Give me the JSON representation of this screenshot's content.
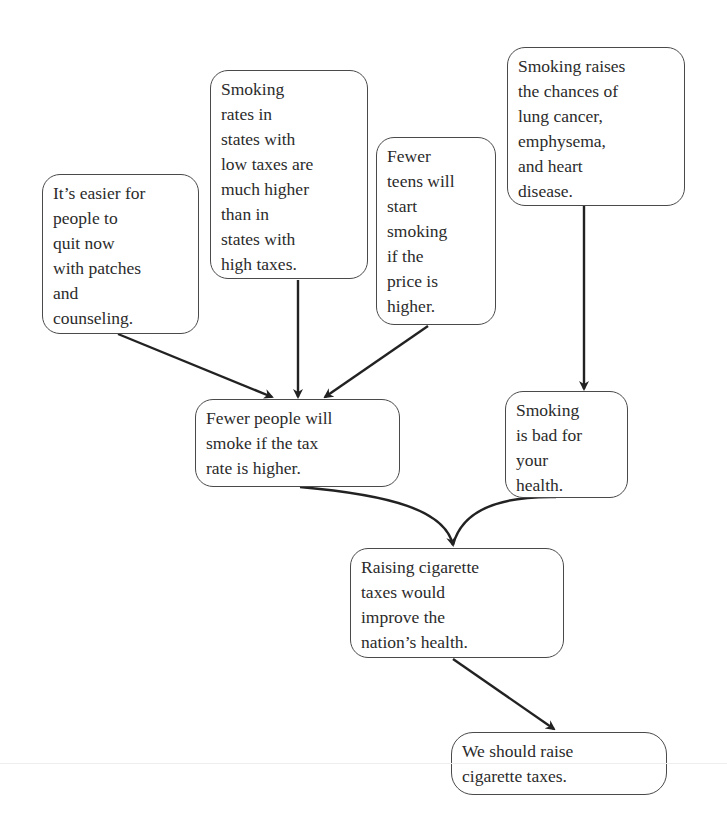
{
  "diagram": {
    "type": "argument-map",
    "nodes": [
      {
        "id": "a",
        "text": "It’s easier for\npeople to\nquit now\nwith patches\nand\ncounseling."
      },
      {
        "id": "b",
        "text": "Smoking\nrates in\nstates with\nlow taxes are\nmuch higher\nthan in\nstates with\nhigh taxes."
      },
      {
        "id": "c",
        "text": "Fewer\nteens will\nstart\nsmoking\nif the\nprice is\nhigher."
      },
      {
        "id": "d",
        "text": "Smoking raises\nthe chances of\nlung cancer,\nemphysema,\nand heart\ndisease."
      },
      {
        "id": "e",
        "text": "Fewer people will\nsmoke if the tax\nrate is higher."
      },
      {
        "id": "f",
        "text": "Smoking\nis bad for\nyour\nhealth."
      },
      {
        "id": "g",
        "text": "Raising cigarette\ntaxes would\nimprove the\nnation’s health."
      },
      {
        "id": "h",
        "text": "We should raise\ncigarette taxes."
      }
    ],
    "edges": [
      {
        "from": "a",
        "to": "e"
      },
      {
        "from": "b",
        "to": "e"
      },
      {
        "from": "c",
        "to": "e"
      },
      {
        "from": "d",
        "to": "f"
      },
      {
        "from": "e",
        "to": "g"
      },
      {
        "from": "f",
        "to": "g"
      },
      {
        "from": "g",
        "to": "h"
      }
    ],
    "colors": {
      "stroke": "#222222",
      "border": "#4a4a4a",
      "text": "#2b2b2b",
      "background": "#ffffff"
    }
  }
}
